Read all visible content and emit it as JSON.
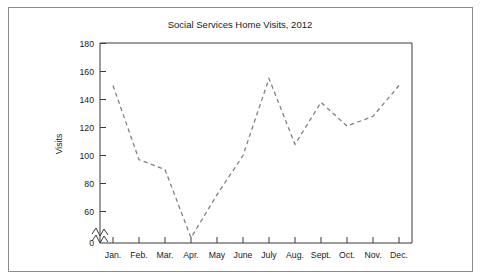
{
  "figure": {
    "title": "Social Services Home Visits, 2012",
    "frame_color": "#8c8c8c",
    "background": "#ffffff",
    "line_color": "#7d7d7d",
    "axis_color": "#3a3a3a"
  },
  "axes": {
    "y_title": "Visits",
    "x_title": "",
    "y_ticks": [
      "0",
      "60",
      "80",
      "100",
      "120",
      "140",
      "160",
      "180"
    ],
    "x_ticks": [
      "Jan.",
      "Feb.",
      "Mar.",
      "Apr.",
      "May",
      "June",
      "July",
      "Aug.",
      "Sept.",
      "Oct.",
      "Nov.",
      "Dec."
    ],
    "y_axis_break": true,
    "grid": false,
    "legend": "none"
  },
  "chart_data": {
    "type": "line",
    "title": "Social Services Home Visits, 2012",
    "xlabel": "",
    "ylabel": "Visits",
    "categories": [
      "Jan.",
      "Feb.",
      "Mar.",
      "Apr.",
      "May",
      "June",
      "July",
      "Aug.",
      "Sept.",
      "Oct.",
      "Nov.",
      "Dec."
    ],
    "values": [
      150,
      97,
      90,
      45,
      72,
      100,
      155,
      108,
      138,
      121,
      128,
      150
    ],
    "ylim": [
      0,
      180
    ],
    "yticks": [
      0,
      60,
      80,
      100,
      120,
      140,
      160,
      180
    ],
    "y_axis_break_between": [
      0,
      60
    ],
    "grid": false,
    "legend_position": "none",
    "line_style": "dashed",
    "markers": "none",
    "series": [
      {
        "name": "Visits",
        "values": [
          150,
          97,
          90,
          45,
          72,
          100,
          155,
          108,
          138,
          121,
          128,
          150
        ]
      }
    ]
  }
}
